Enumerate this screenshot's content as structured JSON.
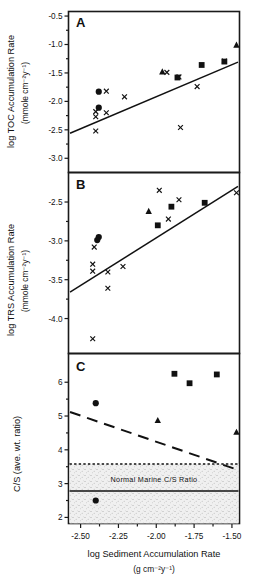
{
  "figure": {
    "xaxis": {
      "title": "log Sediment Accumulation Rate",
      "units": "(g cm⁻²y⁻¹)",
      "ticks": [
        "-2.50",
        "-2.25",
        "-2.00",
        "-1.75",
        "-1.50"
      ],
      "tickvals": [
        -2.5,
        -2.25,
        -2.0,
        -1.75,
        -1.5
      ],
      "range": [
        -2.58,
        -1.45
      ]
    },
    "panels": [
      {
        "letter": "A",
        "ylabel_line1": "log TOC Accumulation Rate",
        "ylabel_line2": "(mmole cm⁻²y⁻¹)",
        "yticks": [
          "-0.5",
          "-1.0",
          "-1.5",
          "-2.0",
          "-2.5",
          "-3.0"
        ],
        "ytickvals": [
          -0.5,
          -1.0,
          -1.5,
          -2.0,
          -2.5,
          -3.0
        ],
        "yrange": [
          -3.25,
          -0.42
        ]
      },
      {
        "letter": "B",
        "ylabel_line1": "log TRS Accumulation Rate",
        "ylabel_line2": "(mmole cm⁻²y⁻¹)",
        "yticks": [
          "-2.5",
          "-3.0",
          "-3.5",
          "-4.0"
        ],
        "ytickvals": [
          -2.5,
          -3.0,
          -3.5,
          -4.0
        ],
        "yrange": [
          -4.45,
          -2.12
        ]
      },
      {
        "letter": "C",
        "ylabel_line1": "C/S (ave. wt. ratio)",
        "ylabel_line2": "",
        "yticks": [
          "6",
          "5",
          "4",
          "3",
          "2"
        ],
        "ytickvals": [
          6,
          5,
          4,
          3,
          2
        ],
        "yrange": [
          1.82,
          6.85
        ],
        "band_label": "Normal Marine C/S Ratio"
      }
    ]
  },
  "chart_data": [
    {
      "type": "scatter",
      "panel": "A",
      "title": "A",
      "xlabel": "log Sediment Accumulation Rate (g cm⁻²y⁻¹)",
      "ylabel": "log TOC Accumulation Rate (mmole cm⁻²y⁻¹)",
      "xlim": [
        -2.58,
        -1.45
      ],
      "ylim": [
        -3.25,
        -0.42
      ],
      "grid": false,
      "legend": "none",
      "series": [
        {
          "name": "cross",
          "marker": "x",
          "points": [
            [
              -2.4,
              -2.18
            ],
            [
              -2.4,
              -2.27
            ],
            [
              -2.4,
              -2.52
            ],
            [
              -2.33,
              -1.82
            ],
            [
              -2.33,
              -2.2
            ],
            [
              -2.21,
              -1.92
            ],
            [
              -1.93,
              -1.49
            ],
            [
              -1.85,
              -1.57
            ],
            [
              -1.84,
              -2.46
            ],
            [
              -1.73,
              -1.74
            ],
            [
              -1.55,
              -1.29
            ]
          ]
        },
        {
          "name": "circle",
          "marker": "filled-circle",
          "points": [
            [
              -2.38,
              -1.83
            ],
            [
              -2.38,
              -2.11
            ]
          ]
        },
        {
          "name": "triangle",
          "marker": "filled-triangle",
          "points": [
            [
              -1.96,
              -1.48
            ],
            [
              -1.47,
              -1.01
            ]
          ]
        },
        {
          "name": "square",
          "marker": "filled-square",
          "points": [
            [
              -1.86,
              -1.58
            ],
            [
              -1.7,
              -1.36
            ],
            [
              -1.55,
              -1.3
            ]
          ]
        }
      ],
      "fit_line": {
        "style": "solid",
        "x": [
          -2.57,
          -1.46
        ],
        "y": [
          -2.56,
          -1.31
        ]
      }
    },
    {
      "type": "scatter",
      "panel": "B",
      "title": "B",
      "xlabel": "log Sediment Accumulation Rate (g cm⁻²y⁻¹)",
      "ylabel": "log TRS Accumulation Rate (mmole cm⁻²y⁻¹)",
      "xlim": [
        -2.58,
        -1.45
      ],
      "ylim": [
        -4.45,
        -2.12
      ],
      "grid": false,
      "legend": "none",
      "series": [
        {
          "name": "cross",
          "marker": "x",
          "points": [
            [
              -2.41,
              -3.08
            ],
            [
              -2.42,
              -3.3
            ],
            [
              -2.42,
              -3.39
            ],
            [
              -2.42,
              -4.26
            ],
            [
              -2.32,
              -3.4
            ],
            [
              -2.32,
              -3.61
            ],
            [
              -2.22,
              -3.33
            ],
            [
              -1.98,
              -2.35
            ],
            [
              -1.92,
              -2.72
            ],
            [
              -1.85,
              -2.47
            ],
            [
              -1.47,
              -2.38
            ]
          ]
        },
        {
          "name": "circle",
          "marker": "filled-circle",
          "points": [
            [
              -2.38,
              -2.95
            ],
            [
              -2.39,
              -2.99
            ]
          ]
        },
        {
          "name": "triangle",
          "marker": "filled-triangle",
          "points": [
            [
              -2.05,
              -2.62
            ]
          ]
        },
        {
          "name": "square",
          "marker": "filled-square",
          "points": [
            [
              -1.99,
              -2.8
            ],
            [
              -1.9,
              -2.56
            ],
            [
              -1.68,
              -2.51
            ]
          ]
        }
      ],
      "fit_line": {
        "style": "solid",
        "x": [
          -2.57,
          -1.46
        ],
        "y": [
          -3.66,
          -2.3
        ]
      }
    },
    {
      "type": "scatter",
      "panel": "C",
      "title": "C",
      "xlabel": "log Sediment Accumulation Rate (g cm⁻²y⁻¹)",
      "ylabel": "C/S (ave. wt. ratio)",
      "xlim": [
        -2.58,
        -1.45
      ],
      "ylim": [
        1.82,
        6.85
      ],
      "grid": false,
      "legend": "none",
      "series": [
        {
          "name": "circle",
          "marker": "filled-circle",
          "points": [
            [
              -2.4,
              5.38
            ],
            [
              -2.4,
              2.5
            ]
          ]
        },
        {
          "name": "triangle",
          "marker": "filled-triangle",
          "points": [
            [
              -1.99,
              4.87
            ],
            [
              -1.47,
              4.52
            ]
          ]
        },
        {
          "name": "square",
          "marker": "filled-square",
          "points": [
            [
              -1.88,
              6.25
            ],
            [
              -1.78,
              5.97
            ],
            [
              -1.6,
              6.23
            ]
          ]
        }
      ],
      "fit_line": {
        "style": "dashed",
        "x": [
          -2.57,
          -1.47
        ],
        "y": [
          5.12,
          3.42
        ]
      },
      "band": {
        "label": "Normal Marine C/S Ratio",
        "upper_dashed": 3.58,
        "lower_solid": 2.78,
        "fill": "stipple"
      }
    }
  ],
  "colors": {
    "ink": "#111111",
    "background": "#ffffff",
    "band_fill": "#d8d8d8"
  }
}
